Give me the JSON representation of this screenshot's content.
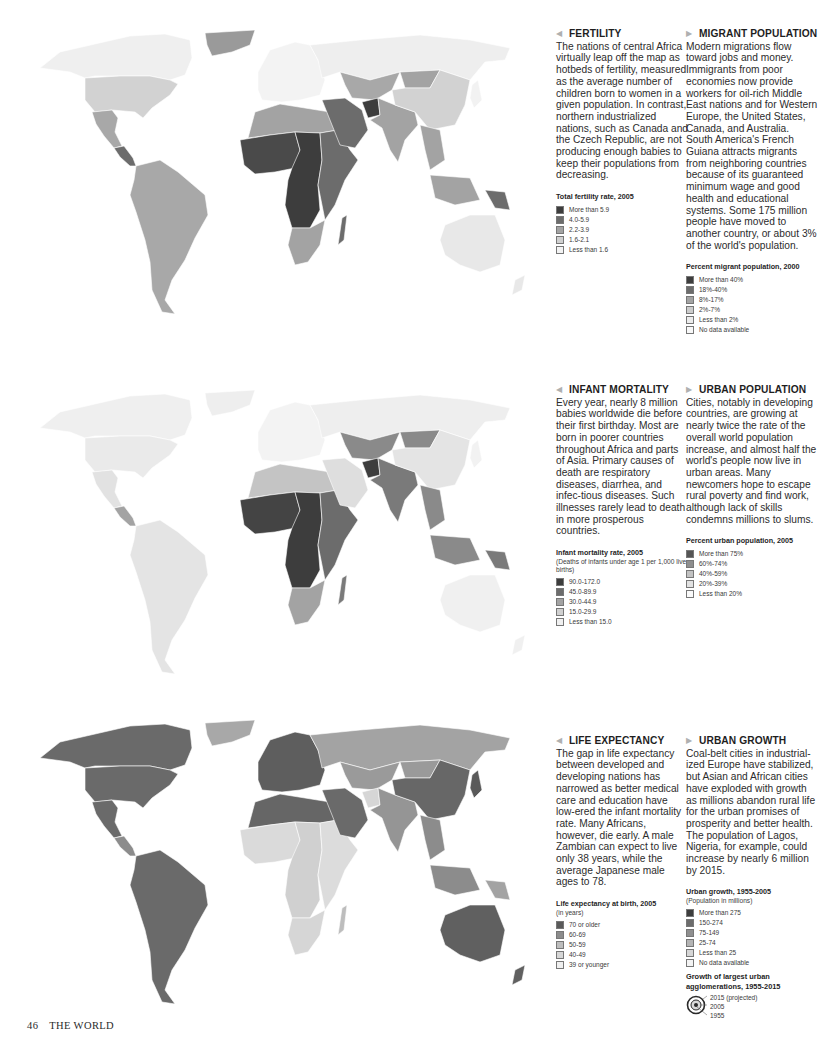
{
  "page": {
    "number": "46",
    "section": "THE WORLD"
  },
  "colors": {
    "grey_1": "#3d3d3d",
    "grey_2": "#6c6c6c",
    "grey_3": "#a3a3a3",
    "grey_4": "#d0d0d0",
    "grey_5": "#eeeeee",
    "nodata": "#f8f8f8"
  },
  "panels": [
    {
      "id": "fertility",
      "title": "FERTILITY",
      "arrow": "◀",
      "body": "The nations of central Africa virtually leap off the map as hotbeds of fertility, measured as the average number of children born to women in a given population. In contrast, northern industrialized nations, such as Canada and the Czech Republic, are not producing enough babies to keep their populations from decreasing.",
      "legend": {
        "title": "Total fertility rate, 2005",
        "subtitle": "",
        "items": [
          {
            "label": "More than 5.9",
            "color": "#3d3d3d"
          },
          {
            "label": "4.0-5.9",
            "color": "#6c6c6c"
          },
          {
            "label": "2.2-3.9",
            "color": "#a3a3a3"
          },
          {
            "label": "1.6-2.1",
            "color": "#d0d0d0"
          },
          {
            "label": "Less than 1.6",
            "color": "#f3f3f3"
          }
        ]
      }
    },
    {
      "id": "migrant-population",
      "title": "MIGRANT POPULATION",
      "arrow": "▶",
      "body": "Modern migrations flow toward jobs and money. Immigrants from poor economies now provide workers for oil-rich Middle East nations and for Western Europe, the United States, Canada, and Australia. South America's French Guiana attracts migrants from neighboring countries because of its guaranteed minimum wage and good health and educational systems. Some 175 million people have moved to another country, or about 3% of the world's population.",
      "legend": {
        "title": "Percent migrant population, 2000",
        "subtitle": "",
        "items": [
          {
            "label": "More than 40%",
            "color": "#3d3d3d"
          },
          {
            "label": "18%-40%",
            "color": "#6c6c6c"
          },
          {
            "label": "8%-17%",
            "color": "#a3a3a3"
          },
          {
            "label": "2%-7%",
            "color": "#cccccc"
          },
          {
            "label": "Less than 2%",
            "color": "#ececec"
          },
          {
            "label": "No data available",
            "color": "#f8f8f8"
          }
        ]
      }
    },
    {
      "id": "infant-mortality",
      "title": "INFANT MORTALITY",
      "arrow": "◀",
      "body": "Every year, nearly 8 million babies worldwide die before their first birthday. Most are born in poorer countries throughout Africa and parts of Asia. Primary causes of death are respiratory diseases, diarrhea, and infec-tious diseases. Such illnesses rarely lead to death in more prosperous countries.",
      "legend": {
        "title": "Infant mortality rate, 2005",
        "subtitle": "(Deaths of infants under age 1 per 1,000 live births)",
        "items": [
          {
            "label": "90.0-172.0",
            "color": "#3d3d3d"
          },
          {
            "label": "45.0-89.9",
            "color": "#6c6c6c"
          },
          {
            "label": "30.0-44.9",
            "color": "#a3a3a3"
          },
          {
            "label": "15.0-29.9",
            "color": "#d0d0d0"
          },
          {
            "label": "Less than 15.0",
            "color": "#f0f0f0"
          }
        ]
      }
    },
    {
      "id": "urban-population",
      "title": "URBAN POPULATION",
      "arrow": "▶",
      "body": "Cities, notably in developing countries, are growing at nearly twice the rate of the overall world population increase, and almost half the world's people now live in urban areas. Many newcomers hope to escape rural poverty and find work, although lack of skills condemns millions to slums.",
      "legend": {
        "title": "Percent urban population, 2005",
        "subtitle": "",
        "items": [
          {
            "label": "More than 75%",
            "color": "#555555"
          },
          {
            "label": "60%-74%",
            "color": "#8e8e8e"
          },
          {
            "label": "40%-59%",
            "color": "#c2c2c2"
          },
          {
            "label": "20%-39%",
            "color": "#e2e2e2"
          },
          {
            "label": "Less than 20%",
            "color": "#fafafa"
          }
        ]
      }
    },
    {
      "id": "life-expectancy",
      "title": "LIFE EXPECTANCY",
      "arrow": "◀",
      "body": "The gap in life expectancy between developed and developing nations has narrowed as better medical care and education have low-ered the infant mortality rate. Many Africans, however, die early. A male Zambian can expect to live only 38 years, while the average Japanese male ages to 78.",
      "legend": {
        "title": "Life expectancy at birth, 2005",
        "subtitle": "(in years)",
        "items": [
          {
            "label": "70 or older",
            "color": "#5a5a5a"
          },
          {
            "label": "60-69",
            "color": "#8c8c8c"
          },
          {
            "label": "50-59",
            "color": "#bdbdbd"
          },
          {
            "label": "40-49",
            "color": "#d6d6d6"
          },
          {
            "label": "39 or younger",
            "color": "#efefef"
          }
        ]
      }
    },
    {
      "id": "urban-growth",
      "title": "URBAN GROWTH",
      "arrow": "▶",
      "body": "Coal-belt cities in industrial-ized Europe have stabilized, but Asian and African cities have exploded with growth as millions abandon rural life for the urban promises of prosperity and better health. The population of Lagos, Nigeria, for example, could increase by nearly 6 million by 2015.",
      "legend": {
        "title": "Urban growth, 1955-2005",
        "subtitle": "(Population in millions)",
        "items": [
          {
            "label": "More than 275",
            "color": "#3d3d3d"
          },
          {
            "label": "150-274",
            "color": "#6c6c6c"
          },
          {
            "label": "75-149",
            "color": "#8f8f8f"
          },
          {
            "label": "25-74",
            "color": "#b4b4b4"
          },
          {
            "label": "Less than 25",
            "color": "#d6d6d6"
          },
          {
            "label": "No data available",
            "color": "#f3f3f3"
          }
        ]
      },
      "sub_legend": {
        "title": "Growth of largest urban agglomerations, 1955-2015",
        "labels": [
          "2015 (projected)",
          "2005",
          "1955"
        ]
      }
    }
  ],
  "maps": [
    {
      "id": "fertility-map",
      "fills": {
        "north_america": "#eaeaea",
        "canada": "#efefef",
        "usa": "#d2d2d2",
        "mexico": "#a8a8a8",
        "central_america": "#6c6c6c",
        "south_america": "#a8a8a8",
        "greenland": "#9a9a9a",
        "europe": "#f3f3f3",
        "russia": "#eeeeee",
        "north_africa": "#a3a3a3",
        "west_africa": "#4a4a4a",
        "central_africa": "#3d3d3d",
        "east_africa": "#6c6c6c",
        "southern_africa": "#a3a3a3",
        "madagascar": "#6c6c6c",
        "middle_east": "#6c6c6c",
        "central_asia": "#a8a8a8",
        "south_asia": "#a3a3a3",
        "afghanistan": "#3d3d3d",
        "china": "#d2d2d2",
        "mongolia": "#a3a3a3",
        "southeast_asia": "#a3a3a3",
        "australia": "#e8e8e8",
        "png": "#6c6c6c",
        "japan": "#f2f2f2"
      }
    },
    {
      "id": "infant-mortality-map",
      "fills": {
        "north_america": "#eaeaea",
        "canada": "#efefef",
        "usa": "#eaeaea",
        "mexico": "#e2e2e2",
        "central_america": "#a3a3a3",
        "south_america": "#e4e4e4",
        "greenland": "#eeeeee",
        "europe": "#f3f3f3",
        "russia": "#eeeeee",
        "north_africa": "#c4c4c4",
        "west_africa": "#444444",
        "central_africa": "#3d3d3d",
        "east_africa": "#6c6c6c",
        "southern_africa": "#a3a3a3",
        "madagascar": "#7a7a7a",
        "middle_east": "#dedede",
        "central_asia": "#8a8a8a",
        "south_asia": "#7a7a7a",
        "afghanistan": "#3d3d3d",
        "china": "#e4e4e4",
        "mongolia": "#8a8a8a",
        "southeast_asia": "#8a8a8a",
        "australia": "#f0f0f0",
        "png": "#7a7a7a",
        "japan": "#f2f2f2"
      }
    },
    {
      "id": "life-expectancy-map",
      "fills": {
        "north_america": "#6a6a6a",
        "canada": "#6a6a6a",
        "usa": "#6a6a6a",
        "mexico": "#6a6a6a",
        "central_america": "#8c8c8c",
        "south_america": "#6a6a6a",
        "greenland": "#a8a8a8",
        "europe": "#5e5e5e",
        "russia": "#a3a3a3",
        "north_africa": "#666666",
        "west_africa": "#dadada",
        "central_africa": "#d0d0d0",
        "east_africa": "#dcdcdc",
        "southern_africa": "#d6d6d6",
        "madagascar": "#bdbdbd",
        "middle_east": "#6a6a6a",
        "central_asia": "#9a9a9a",
        "south_asia": "#959595",
        "afghanistan": "#d6d6d6",
        "china": "#676767",
        "mongolia": "#9a9a9a",
        "southeast_asia": "#8c8c8c",
        "australia": "#606060",
        "png": "#a3a3a3",
        "japan": "#5a5a5a"
      }
    }
  ]
}
